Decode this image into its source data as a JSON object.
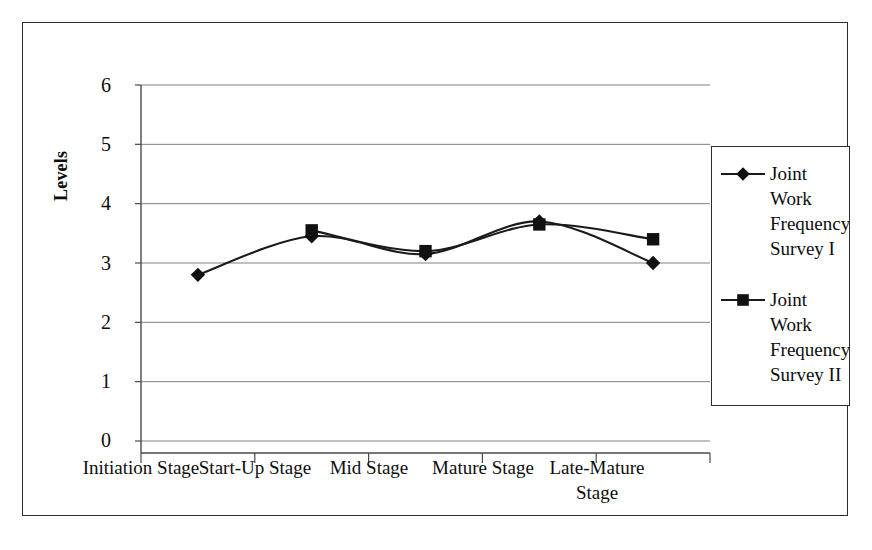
{
  "chart_data": {
    "type": "line",
    "title": "",
    "xlabel": "",
    "ylabel": "Levels",
    "ylim": [
      0,
      6
    ],
    "ytick_step": 1,
    "grid": true,
    "legend_position": "right",
    "categories": [
      "Initiation Stage",
      "Start-Up Stage",
      "Mid Stage",
      "Mature Stage",
      "Late-Mature Stage"
    ],
    "ytick_labels": [
      "0",
      "1",
      "2",
      "3",
      "4",
      "5",
      "6"
    ],
    "series": [
      {
        "name": "Joint Work Frequency Survey I",
        "marker": "diamond",
        "values": [
          2.8,
          3.45,
          3.15,
          3.7,
          3.0
        ]
      },
      {
        "name": "Joint Work Frequency Survey II",
        "marker": "square",
        "values": [
          null,
          3.55,
          3.2,
          3.65,
          3.4
        ]
      }
    ],
    "colors": {
      "series_line": "#1a1a1a",
      "marker": "#111111",
      "gridline": "#808080",
      "axis": "#4a4a4a",
      "frame": "#2c2c2c",
      "background": "#ffffff"
    }
  },
  "legend": {
    "entries": [
      {
        "label": "Joint\nWork\nFrequency\nSurvey I",
        "marker": "diamond"
      },
      {
        "label": "Joint\nWork\nFrequency\nSurvey II",
        "marker": "square"
      }
    ]
  },
  "axis": {
    "y_title": "Levels"
  }
}
